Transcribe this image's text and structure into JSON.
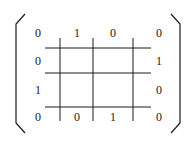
{
  "diagram": {
    "type": "bracketed-matrix-grid",
    "matrix": [
      [
        "0",
        "1",
        "0",
        "0"
      ],
      [
        "0",
        "",
        "",
        "1"
      ],
      [
        "1",
        "",
        "",
        "0"
      ],
      [
        "0",
        "0",
        "1",
        "0"
      ]
    ],
    "colors": {
      "stroke": "#1a1a1a",
      "text": "#1a1a1a",
      "background": "#ffffff"
    }
  }
}
